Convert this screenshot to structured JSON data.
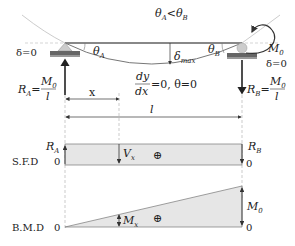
{
  "beam": {
    "angle_relation": {
      "theta_a": "θ",
      "sub_a": "A",
      "lt": "<",
      "theta_b": "θ",
      "sub_b": "B"
    },
    "left_support": {
      "delta_label": "δ=0",
      "theta": "θ",
      "theta_sub": "A",
      "reaction": {
        "R": "R",
        "sub": "A",
        "eq": "=",
        "num": "M",
        "num_sub": "0",
        "den": "l"
      }
    },
    "right_support": {
      "moment": "M",
      "moment_sub": "0",
      "delta_label": "δ=0",
      "theta": "θ",
      "theta_sub": "B",
      "reaction": {
        "R": "R",
        "sub": "B",
        "eq": "=",
        "num": "M",
        "num_sub": "0",
        "den": "l"
      }
    },
    "deflection": {
      "delta": "δ",
      "sub": "max"
    },
    "slope_condition": {
      "dy": "dy",
      "dx": "dx",
      "rest": "=0,  θ=0"
    },
    "x_label": "x",
    "span_label": "l"
  },
  "sfd": {
    "label": "S.F.D",
    "zero_left": "0",
    "zero_right": "0",
    "ra": {
      "R": "R",
      "sub": "A"
    },
    "rb": {
      "R": "R",
      "sub": "B"
    },
    "vx": {
      "V": "V",
      "sub": "x"
    },
    "sign": "⊕",
    "fill_color": "#e6e6e6"
  },
  "bmd": {
    "label": "B.M.D",
    "zero_left": "0",
    "zero_right": "0",
    "mx": {
      "M": "M",
      "sub": "x"
    },
    "m0": {
      "M": "M",
      "sub": "0"
    },
    "sign": "⊕",
    "fill_color": "#e6e6e6"
  }
}
